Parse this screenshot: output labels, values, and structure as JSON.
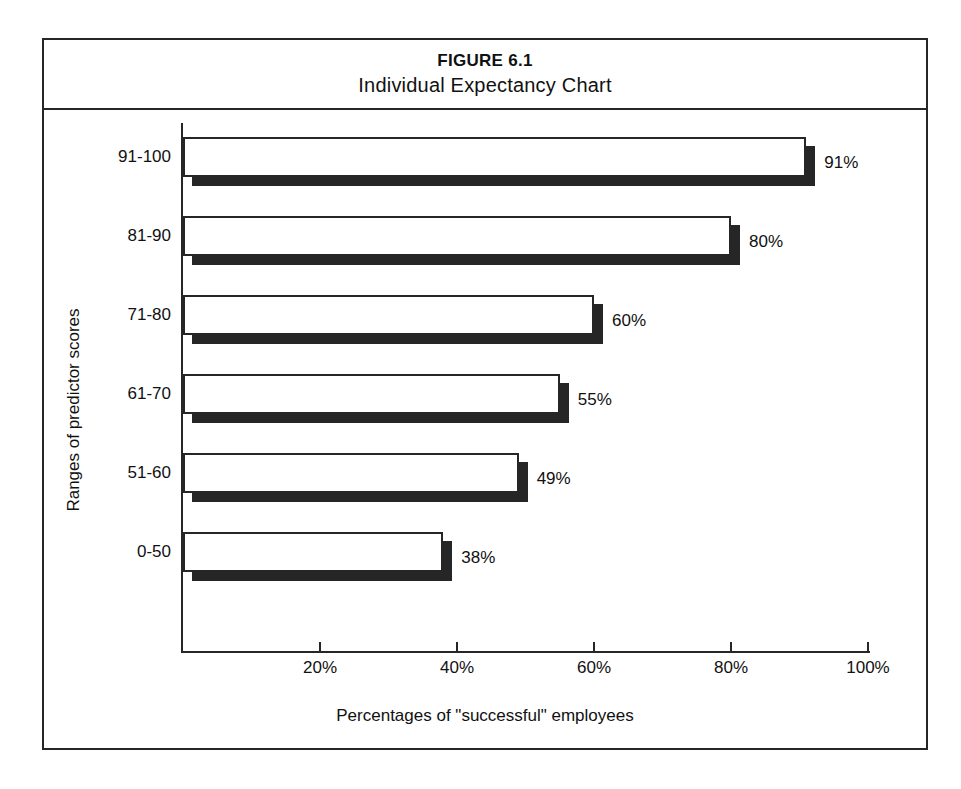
{
  "figure": {
    "number": "FIGURE 6.1",
    "title": "Individual Expectancy Chart"
  },
  "chart_data": {
    "type": "bar",
    "orientation": "horizontal",
    "title": "Individual Expectancy Chart",
    "subtitle": "FIGURE 6.1",
    "xlabel": "Percentages of \"successful\" employees",
    "ylabel": "Ranges of predictor scores",
    "categories": [
      "0-50",
      "51-60",
      "61-70",
      "71-80",
      "81-90",
      "91-100"
    ],
    "values": [
      38,
      49,
      55,
      60,
      80,
      91
    ],
    "data_labels": [
      "38%",
      "49%",
      "55%",
      "60%",
      "80%",
      "91%"
    ],
    "xlim": [
      0,
      100
    ],
    "ylim": null,
    "xticks": [
      20,
      40,
      60,
      80,
      100
    ],
    "xtick_labels": [
      "20%",
      "40%",
      "60%",
      "80%",
      "100%"
    ],
    "grid": false,
    "legend": null,
    "series": [
      {
        "name": "Percentage successful",
        "values": [
          38,
          49,
          55,
          60,
          80,
          91
        ]
      }
    ],
    "bars": [
      {
        "category": "91-100",
        "value": 91,
        "label": "91%"
      },
      {
        "category": "81-90",
        "value": 80,
        "label": "80%"
      },
      {
        "category": "71-80",
        "value": 60,
        "label": "60%"
      },
      {
        "category": "61-70",
        "value": 55,
        "label": "55%"
      },
      {
        "category": "51-60",
        "value": 49,
        "label": "49%"
      },
      {
        "category": "0-50",
        "value": 38,
        "label": "38%"
      }
    ]
  },
  "colors": {
    "bar_face": "#ffffff",
    "bar_outline": "#262626",
    "bar_shadow": "#262626",
    "frame": "#262626",
    "text": "#111111",
    "background": "#ffffff"
  }
}
